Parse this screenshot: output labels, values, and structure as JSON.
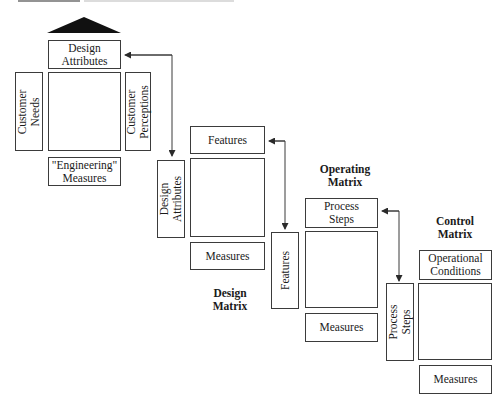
{
  "figure": {
    "caption_visible": "clipped caption strip at top (illegible)"
  },
  "matrices": [
    {
      "id": "house-of-quality",
      "label": "",
      "top": {
        "lines": [
          "Design",
          "Attributes"
        ]
      },
      "left": {
        "lines": [
          "Customer",
          "Needs"
        ]
      },
      "right": {
        "lines": [
          "Customer",
          "Perceptions"
        ]
      },
      "bottom": {
        "lines": [
          "\"Engineering\"",
          "Measures"
        ]
      },
      "has_roof": true
    },
    {
      "id": "design-matrix",
      "label": {
        "lines": [
          "Design",
          "Matrix"
        ]
      },
      "top": {
        "lines": [
          "Features"
        ]
      },
      "left": {
        "lines": [
          "Design",
          "Attributes"
        ]
      },
      "bottom": {
        "lines": [
          "Measures"
        ]
      }
    },
    {
      "id": "operating-matrix",
      "label": {
        "lines": [
          "Operating",
          "Matrix"
        ]
      },
      "top": {
        "lines": [
          "Process",
          "Steps"
        ]
      },
      "left": {
        "lines": [
          "Features"
        ]
      },
      "bottom": {
        "lines": [
          "Measures"
        ]
      }
    },
    {
      "id": "control-matrix",
      "label": {
        "lines": [
          "Control",
          "Matrix"
        ]
      },
      "top": {
        "lines": [
          "Operational",
          "Conditions"
        ]
      },
      "left": {
        "lines": [
          "Process",
          "Steps"
        ]
      },
      "bottom": {
        "lines": [
          "Measures"
        ]
      }
    }
  ],
  "connectors": [
    {
      "from": "house-of-quality.top",
      "to": "design-matrix.left",
      "label": "Design Attributes",
      "type": "double-arrow"
    },
    {
      "from": "design-matrix.top",
      "to": "operating-matrix.left",
      "label": "Features",
      "type": "double-arrow"
    },
    {
      "from": "operating-matrix.top",
      "to": "control-matrix.left",
      "label": "Process Steps",
      "type": "double-arrow"
    }
  ],
  "colors": {
    "line": "#3b3b3b",
    "roof": "#111111",
    "background": "#ffffff"
  }
}
